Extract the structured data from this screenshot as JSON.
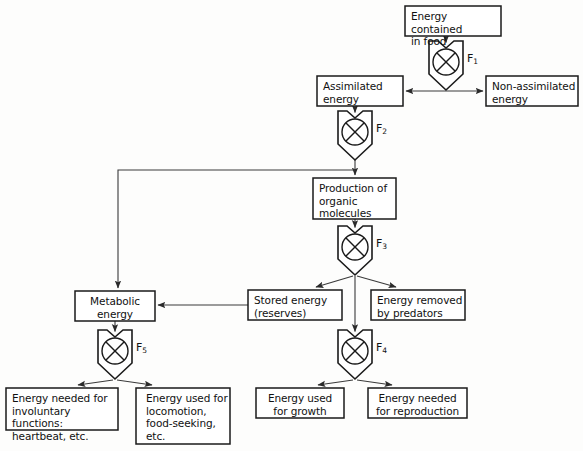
{
  "diagram": {
    "type": "flow-diagram",
    "stroke_color": "#1a1a1a",
    "connector_color": "#3a3a3a",
    "background_color": "#fdfdfc",
    "boxes": [
      {
        "id": "energy-in-food",
        "label": "Energy contained\nin food",
        "x": 405,
        "y": 6,
        "w": 96,
        "h": 30,
        "align": "left"
      },
      {
        "id": "assimilated-energy",
        "label": "Assimilated\nenergy",
        "x": 317,
        "y": 76,
        "w": 86,
        "h": 30,
        "align": "left"
      },
      {
        "id": "non-assimilated-energy",
        "label": "Non-assimilated\nenergy",
        "x": 486,
        "y": 76,
        "w": 92,
        "h": 30,
        "align": "left"
      },
      {
        "id": "production-organic",
        "label": "Production of\norganic\nmolecules",
        "x": 313,
        "y": 178,
        "w": 83,
        "h": 41,
        "align": "left"
      },
      {
        "id": "metabolic-energy",
        "label": "Metabolic\nenergy",
        "x": 75,
        "y": 291,
        "w": 80,
        "h": 30,
        "align": "center"
      },
      {
        "id": "stored-energy",
        "label": "Stored energy\n(reserves)",
        "x": 248,
        "y": 290,
        "w": 94,
        "h": 30,
        "align": "left"
      },
      {
        "id": "energy-removed",
        "label": "Energy removed\nby predators",
        "x": 371,
        "y": 290,
        "w": 94,
        "h": 30,
        "align": "left"
      },
      {
        "id": "involuntary-functions",
        "label": "Energy needed for\ninvoluntary functions:\nheartbeat, etc.",
        "x": 6,
        "y": 388,
        "w": 112,
        "h": 42,
        "align": "left"
      },
      {
        "id": "locomotion",
        "label": "Energy used for\nlocomotion,\nfood-seeking,\netc.",
        "x": 136,
        "y": 388,
        "w": 94,
        "h": 56,
        "align": "left"
      },
      {
        "id": "energy-growth",
        "label": "Energy used\nfor growth",
        "x": 256,
        "y": 388,
        "w": 88,
        "h": 30,
        "align": "center"
      },
      {
        "id": "energy-reproduction",
        "label": "Energy needed\nfor reproduction",
        "x": 368,
        "y": 388,
        "w": 99,
        "h": 30,
        "align": "center"
      }
    ],
    "valves": [
      {
        "id": "valve-f1",
        "label": "F",
        "subscript": "1",
        "cx": 446,
        "top": 41,
        "w": 34,
        "h": 48
      },
      {
        "id": "valve-f2",
        "label": "F",
        "subscript": "2",
        "cx": 355,
        "top": 111,
        "w": 34,
        "h": 48
      },
      {
        "id": "valve-f3",
        "label": "F",
        "subscript": "3",
        "cx": 355,
        "top": 226,
        "w": 34,
        "h": 48
      },
      {
        "id": "valve-f4",
        "label": "F",
        "subscript": "4",
        "cx": 355,
        "top": 330,
        "w": 34,
        "h": 48
      },
      {
        "id": "valve-f5",
        "label": "F",
        "subscript": "5",
        "cx": 115,
        "top": 330,
        "w": 34,
        "h": 48
      }
    ],
    "connections": [
      {
        "id": "food-to-f1",
        "from": "energy-in-food",
        "to": "valve-f1",
        "kind": "arrow-down"
      },
      {
        "id": "f1-to-assimilated",
        "from": "valve-f1",
        "to": "assimilated-energy",
        "kind": "arrow-left"
      },
      {
        "id": "f1-to-non-assimilated",
        "from": "valve-f1",
        "to": "non-assimilated-energy",
        "kind": "arrow-right"
      },
      {
        "id": "assimilated-to-f2",
        "from": "assimilated-energy",
        "to": "valve-f2",
        "kind": "arrow-down"
      },
      {
        "id": "f2-to-production",
        "from": "valve-f2",
        "to": "production-organic",
        "kind": "arrow-down"
      },
      {
        "id": "f2-to-metabolic",
        "from": "valve-f2",
        "to": "metabolic-energy",
        "kind": "elbow-left-down"
      },
      {
        "id": "production-to-f3",
        "from": "production-organic",
        "to": "valve-f3",
        "kind": "arrow-down"
      },
      {
        "id": "f3-to-stored",
        "from": "valve-f3",
        "to": "stored-energy",
        "kind": "arrow-diagonal-left"
      },
      {
        "id": "f3-to-predators",
        "from": "valve-f3",
        "to": "energy-removed",
        "kind": "arrow-diagonal-right"
      },
      {
        "id": "f3-to-f4",
        "from": "valve-f3",
        "to": "valve-f4",
        "kind": "arrow-down"
      },
      {
        "id": "stored-to-metabolic",
        "from": "stored-energy",
        "to": "metabolic-energy",
        "kind": "arrow-left"
      },
      {
        "id": "metabolic-to-f5",
        "from": "metabolic-energy",
        "to": "valve-f5",
        "kind": "arrow-down"
      },
      {
        "id": "f5-to-involuntary",
        "from": "valve-f5",
        "to": "involuntary-functions",
        "kind": "arrow-diagonal-left"
      },
      {
        "id": "f5-to-locomotion",
        "from": "valve-f5",
        "to": "locomotion",
        "kind": "arrow-diagonal-right"
      },
      {
        "id": "f4-to-growth",
        "from": "valve-f4",
        "to": "energy-growth",
        "kind": "arrow-diagonal-left"
      },
      {
        "id": "f4-to-reproduction",
        "from": "valve-f4",
        "to": "energy-reproduction",
        "kind": "arrow-diagonal-right"
      }
    ]
  }
}
